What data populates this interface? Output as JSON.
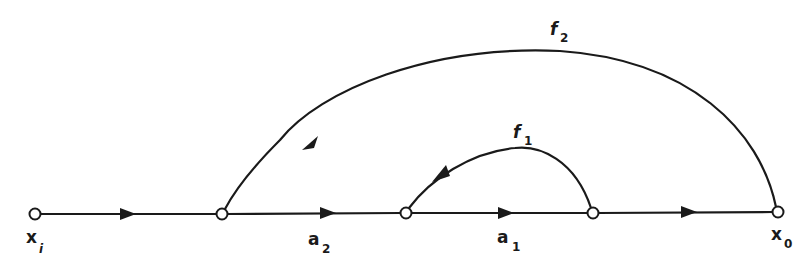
{
  "diagram": {
    "type": "signal-flow-graph",
    "nodes": [
      {
        "id": "xi",
        "label": "x",
        "sub": "i",
        "x": 35,
        "y": 214
      },
      {
        "id": "n1",
        "label": "",
        "sub": "",
        "x": 222,
        "y": 214
      },
      {
        "id": "n2",
        "label": "",
        "sub": "",
        "x": 406,
        "y": 213
      },
      {
        "id": "n3",
        "label": "",
        "sub": "",
        "x": 593,
        "y": 213
      },
      {
        "id": "x0",
        "label": "x",
        "sub": "0",
        "x": 778,
        "y": 212
      }
    ],
    "edges": [
      {
        "from": "xi",
        "to": "n1",
        "gain": ""
      },
      {
        "from": "n1",
        "to": "n2",
        "gain": "a",
        "gain_sub": "2"
      },
      {
        "from": "n2",
        "to": "n3",
        "gain": "a",
        "gain_sub": "1"
      },
      {
        "from": "n3",
        "to": "x0",
        "gain": ""
      },
      {
        "from": "n3",
        "to": "n2",
        "gain": "f",
        "gain_sub": "1",
        "kind": "feedback"
      },
      {
        "from": "x0",
        "to": "n1",
        "gain": "f",
        "gain_sub": "2",
        "kind": "feedback"
      }
    ],
    "labels": {
      "xi_main": "x",
      "xi_sub": "i",
      "x0_main": "x",
      "x0_sub": "0",
      "a2_main": "a",
      "a2_sub": "2",
      "a1_main": "a",
      "a1_sub": "1",
      "f1_main": "f",
      "f1_sub": "1",
      "f2_main": "f",
      "f2_sub": "2"
    }
  }
}
